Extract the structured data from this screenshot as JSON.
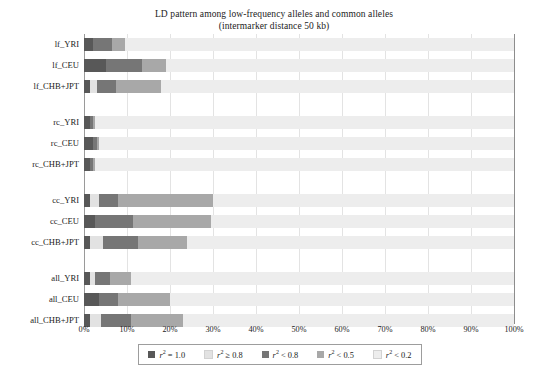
{
  "title": {
    "line1": "LD pattern among low-frequency alleles and common alleles",
    "line2": "(intermarker distance 50 kb)"
  },
  "axis": {
    "xlabel": "",
    "ylabel": "",
    "xticks": [
      "0%",
      "10%",
      "20%",
      "30%",
      "40%",
      "50%",
      "60%",
      "70%",
      "80%",
      "90%",
      "100%"
    ]
  },
  "legend": {
    "items": [
      {
        "label": "r2 = 1.0",
        "math_pre": "r",
        "math_sup": "2",
        "math_post": " = 1.0",
        "color": "#585858"
      },
      {
        "label": "r2 ≥ 0.8",
        "math_pre": "r",
        "math_sup": "2",
        "math_post": " ≥ 0.8",
        "color": "#e2e2e2"
      },
      {
        "label": "r2 < 0.8",
        "math_pre": "r",
        "math_sup": "2",
        "math_post": " < 0.8",
        "color": "#767676"
      },
      {
        "label": "r2 < 0.5",
        "math_pre": "r",
        "math_sup": "2",
        "math_post": " < 0.5",
        "color": "#a8a8a8"
      },
      {
        "label": "r2 < 0.2",
        "math_pre": "r",
        "math_sup": "2",
        "math_post": " < 0.2",
        "color": "#ededed"
      }
    ]
  },
  "chart_data": {
    "type": "bar",
    "orientation": "horizontal",
    "stacked": true,
    "stacked_percent": true,
    "title": "LD pattern among low-frequency alleles and common alleles (intermarker distance 50 kb)",
    "xlabel": "",
    "ylabel": "",
    "xlim": [
      0,
      100
    ],
    "xticks": [
      0,
      10,
      20,
      30,
      40,
      50,
      60,
      70,
      80,
      90,
      100
    ],
    "grid": "vertical",
    "legend_position": "bottom",
    "series": [
      {
        "name": "r2 = 1.0",
        "color": "#585858",
        "values": [
          2.0,
          5.0,
          1.5,
          1.5,
          2.0,
          1.5,
          1.5,
          2.5,
          1.5,
          1.5,
          3.5,
          1.5
        ]
      },
      {
        "name": "r2 ≥ 0.8",
        "color": "#e2e2e2",
        "values": [
          0.0,
          0.0,
          1.5,
          0.0,
          0.0,
          0.0,
          2.0,
          0.0,
          3.0,
          1.0,
          0.0,
          2.5
        ]
      },
      {
        "name": "r2 < 0.8",
        "color": "#767676",
        "values": [
          4.5,
          8.5,
          4.5,
          0.5,
          1.0,
          0.5,
          4.5,
          9.0,
          8.0,
          3.5,
          4.5,
          7.0
        ]
      },
      {
        "name": "r2 < 0.5",
        "color": "#a8a8a8",
        "values": [
          3.0,
          5.5,
          10.5,
          0.5,
          0.5,
          0.5,
          22.0,
          18.0,
          11.5,
          5.0,
          12.0,
          12.0
        ]
      },
      {
        "name": "r2 < 0.2",
        "color": "#ededed",
        "values": [
          90.5,
          81.0,
          82.0,
          97.5,
          96.5,
          97.5,
          70.0,
          70.5,
          76.0,
          89.0,
          80.0,
          77.0
        ]
      }
    ],
    "categories": [
      "lf_YRI",
      "lf_CEU",
      "lf_CHB+JPT",
      "rc_YRI",
      "rc_CEU",
      "rc_CHB+JPT",
      "cc_YRI",
      "cc_CEU",
      "cc_CHB+JPT",
      "all_YRI",
      "all_CEU",
      "all_CHB+JPT"
    ],
    "groups": [
      {
        "name": "lf",
        "rows": [
          "lf_YRI",
          "lf_CEU",
          "lf_CHB+JPT"
        ]
      },
      {
        "name": "rc",
        "rows": [
          "rc_YRI",
          "rc_CEU",
          "rc_CHB+JPT"
        ]
      },
      {
        "name": "cc",
        "rows": [
          "cc_YRI",
          "cc_CEU",
          "cc_CHB+JPT"
        ]
      },
      {
        "name": "all",
        "rows": [
          "all_YRI",
          "all_CEU",
          "all_CHB+JPT"
        ]
      }
    ]
  },
  "rows": [
    {
      "label": "lf_YRI",
      "top": 4,
      "values": [
        2.0,
        0.0,
        4.5,
        3.0,
        90.5
      ]
    },
    {
      "label": "lf_CEU",
      "top": 25,
      "values": [
        5.0,
        0.0,
        8.5,
        5.5,
        81.0
      ]
    },
    {
      "label": "lf_CHB+JPT",
      "top": 46,
      "values": [
        1.5,
        1.5,
        4.5,
        10.5,
        82.0
      ]
    },
    {
      "label": "rc_YRI",
      "top": 82,
      "values": [
        1.5,
        0.0,
        0.5,
        0.5,
        97.5
      ]
    },
    {
      "label": "rc_CEU",
      "top": 103,
      "values": [
        2.0,
        0.0,
        1.0,
        0.5,
        96.5
      ]
    },
    {
      "label": "rc_CHB+JPT",
      "top": 124,
      "values": [
        1.5,
        0.0,
        0.5,
        0.5,
        97.5
      ]
    },
    {
      "label": "cc_YRI",
      "top": 160,
      "values": [
        1.5,
        2.0,
        4.5,
        22.0,
        70.0
      ]
    },
    {
      "label": "cc_CEU",
      "top": 181,
      "values": [
        2.5,
        0.0,
        9.0,
        18.0,
        70.5
      ]
    },
    {
      "label": "cc_CHB+JPT",
      "top": 202,
      "values": [
        1.5,
        3.0,
        8.0,
        11.5,
        76.0
      ]
    },
    {
      "label": "all_YRI",
      "top": 238,
      "values": [
        1.5,
        1.0,
        3.5,
        5.0,
        89.0
      ]
    },
    {
      "label": "all_CEU",
      "top": 259,
      "values": [
        3.5,
        0.0,
        4.5,
        12.0,
        80.0
      ]
    },
    {
      "label": "all_CHB+JPT",
      "top": 280,
      "values": [
        1.5,
        2.5,
        7.0,
        12.0,
        77.0
      ]
    }
  ]
}
